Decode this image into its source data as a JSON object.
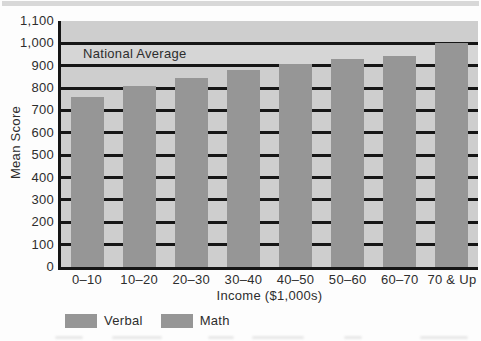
{
  "chart_data": {
    "type": "bar",
    "title": "",
    "categories": [
      "0–10",
      "10–20",
      "20–30",
      "30–40",
      "40–50",
      "50–60",
      "60–70",
      "70 & Up"
    ],
    "values": [
      760,
      810,
      845,
      880,
      910,
      930,
      945,
      1000
    ],
    "xlabel": "Income ($1,000s)",
    "ylabel": "Mean Score",
    "ylim": [
      0,
      1100
    ],
    "ytick_step": 100,
    "ytick_labels": [
      "0",
      "100",
      "200",
      "300",
      "400",
      "500",
      "600",
      "700",
      "800",
      "900",
      "1,000",
      "1,100"
    ],
    "grid": "horizontal-black-lines-every-100",
    "annotation": {
      "text": "National Average",
      "y": 1000
    },
    "legend": {
      "position": "bottom-left",
      "items": [
        {
          "label": "Verbal",
          "color": "#969696"
        },
        {
          "label": "Math",
          "color": "#969696"
        }
      ]
    },
    "colors": {
      "bar": "#969696",
      "plot_background": "#cecece",
      "national_average_band": "#d6d6d6",
      "gridline": "#161616",
      "text": "#2d2d2d",
      "top_strip": "#d8d8d8"
    }
  }
}
